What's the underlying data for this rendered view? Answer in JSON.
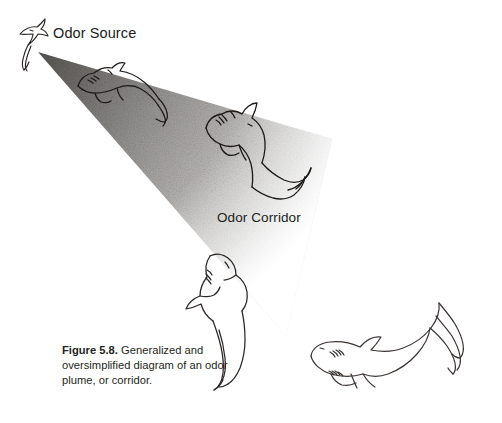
{
  "figure": {
    "domain": "Diagram",
    "background_color": "#ffffff",
    "labels": {
      "odor_source": "Odor Source",
      "odor_corridor": "Odor Corridor"
    },
    "caption": {
      "number": "Figure 5.8.",
      "text": " Generalized and oversimplified diagram of an odor plume, or corridor."
    },
    "plume": {
      "name": "odor-plume-cone",
      "shape": "triangular-cone",
      "apex": [
        38,
        52
      ],
      "upper_edge_end": [
        330,
        140
      ],
      "lower_edge_end": [
        285,
        335
      ],
      "gradient_dark": "#5d5b59",
      "gradient_mid": "#a8a6a4",
      "gradient_light": "#e8e7e6",
      "gradient_fade": "#ffffff",
      "texture": "stippled-grain"
    },
    "sharks": [
      {
        "name": "shark-at-source",
        "position": [
          18,
          22
        ],
        "size": "small",
        "orientation": "swimming-up-left",
        "stroke": "#2b2725"
      },
      {
        "name": "shark-in-plume-upper",
        "position": [
          72,
          68
        ],
        "size": "medium",
        "orientation": "head-left-tail-right",
        "stroke": "#1d1a18"
      },
      {
        "name": "shark-in-plume-mid",
        "position": [
          200,
          112
        ],
        "size": "large",
        "orientation": "head-upper-left-tail-down-right",
        "stroke": "#1d1a18"
      },
      {
        "name": "shark-in-plume-lower",
        "position": [
          188,
          248
        ],
        "size": "large",
        "orientation": "head-up-tail-down",
        "stroke": "#2b2725"
      },
      {
        "name": "shark-outside-plume",
        "position": [
          305,
          318
        ],
        "size": "large",
        "orientation": "head-left-tail-up-right",
        "stroke": "#3a3533"
      }
    ]
  }
}
